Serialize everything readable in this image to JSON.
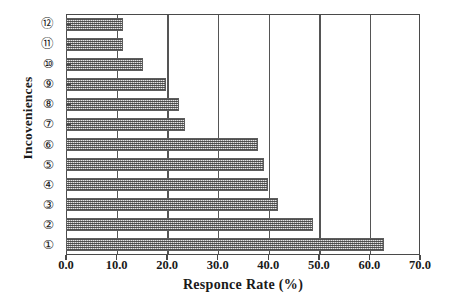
{
  "chart_data": {
    "type": "bar",
    "orientation": "horizontal",
    "title": "",
    "xlabel": "Responce  Rate  (%)",
    "ylabel": "Incoveniences",
    "categories": [
      "①",
      "②",
      "③",
      "④",
      "⑤",
      "⑥",
      "⑦",
      "⑧",
      "⑨",
      "⑩",
      "⑪",
      "⑫"
    ],
    "values": [
      62.8,
      48.9,
      42.0,
      40.0,
      39.1,
      38.0,
      23.5,
      22.4,
      19.7,
      15.2,
      11.2,
      11.2
    ],
    "xlim": [
      0.0,
      70.0
    ],
    "xticks": [
      "0.0",
      "10.0",
      "20.0",
      "30.0",
      "40.0",
      "50.0",
      "60.0",
      "70.0"
    ],
    "xtick_values": [
      0,
      10,
      20,
      30,
      40,
      50,
      60,
      70
    ],
    "grid": "vertical",
    "legend": "none",
    "bar_fill": "#9a9a9a",
    "bar_edge": "#5d5d5d",
    "axis_color": "#4a4a4a"
  }
}
